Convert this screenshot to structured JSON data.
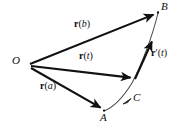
{
  "figure": {
    "name": "vector-valued-function-diagram",
    "background_color": "#ffffff",
    "stroke_color": "#111111",
    "curve_color": "#4a4a4a",
    "width": 185,
    "height": 125
  },
  "points": [
    {
      "id": "O",
      "label": "O",
      "x": 16,
      "y": 62,
      "vertex_x": 30,
      "vertex_y": 64
    },
    {
      "id": "B",
      "label": "B",
      "x": 163,
      "y": 8,
      "vertex_x": 158,
      "vertex_y": 12
    },
    {
      "id": "A",
      "label": "A",
      "x": 101,
      "y": 117,
      "vertex_x": 104,
      "vertex_y": 110
    },
    {
      "id": "C",
      "label": "C",
      "x": 134,
      "y": 97,
      "vertex_x": 130,
      "vertex_y": 101
    }
  ],
  "vectors": [
    {
      "id": "r_b",
      "label_bold": "r",
      "label_open": "(",
      "label_arg": "b",
      "label_close": ")",
      "label_x": 74,
      "label_y": 23,
      "from_x": 30,
      "from_y": 64,
      "to_x": 157,
      "to_y": 13
    },
    {
      "id": "r_t",
      "label_bold": "r",
      "label_open": "(",
      "label_arg": "t",
      "label_close": ")",
      "label_x": 79,
      "label_y": 55,
      "from_x": 31,
      "from_y": 66,
      "to_x": 134,
      "to_y": 78
    },
    {
      "id": "r_a",
      "label_bold": "r",
      "label_open": "(",
      "label_arg": "a",
      "label_close": ")",
      "label_x": 40,
      "label_y": 85,
      "from_x": 31,
      "from_y": 68,
      "to_x": 103,
      "to_y": 109
    },
    {
      "id": "r_prime_t",
      "label_bold": "r",
      "label_prime": "′",
      "label_open": "(",
      "label_arg": "t",
      "label_close": ")",
      "label_x": 152,
      "label_y": 52,
      "from_x": 135,
      "from_y": 79,
      "to_x": 153,
      "to_y": 39
    }
  ],
  "curve": {
    "id": "trajectory-curve",
    "description": "smooth space curve through A, C and B",
    "path": "M 104 111 C 114 107, 124 96, 132 83 C 141 66, 152 38, 158 13"
  }
}
